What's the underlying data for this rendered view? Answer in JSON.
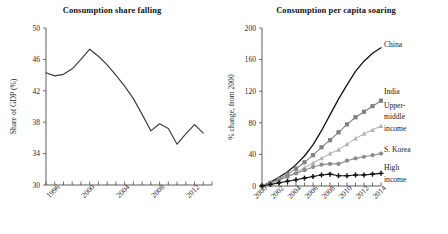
{
  "figure": {
    "panels": [
      {
        "id": "consumption-share",
        "title": "Consumption share falling"
      },
      {
        "id": "consumption-per-capita",
        "title": "Consumption per capita soaring"
      }
    ]
  },
  "chart_data": [
    {
      "type": "line",
      "id": "consumption-share",
      "title": "Consumption share falling",
      "xlabel": "",
      "ylabel": "Share of GDP (%)",
      "xlim": [
        1995,
        2014
      ],
      "ylim": [
        30,
        50
      ],
      "xticks": [
        1996,
        2000,
        2004,
        2008,
        2012
      ],
      "xtick_labels": [
        "1996",
        "2000",
        "2004",
        "2008",
        "2012"
      ],
      "minor_xticks": [
        1995,
        1996,
        1997,
        1998,
        1999,
        2000,
        2001,
        2002,
        2003,
        2004,
        2005,
        2006,
        2007,
        2008,
        2009,
        2010,
        2011,
        2012,
        2013,
        2014
      ],
      "yticks": [
        30,
        34,
        38,
        42,
        46,
        50
      ],
      "ytick_labels": [
        "30",
        "34",
        "38",
        "42",
        "46",
        "50"
      ],
      "grid": false,
      "legend": "none",
      "series": [
        {
          "name": "Share of GDP",
          "color": "#3a3a3a",
          "marker": "none",
          "x": [
            1995,
            1996,
            1997,
            1998,
            1999,
            2000,
            2001,
            2002,
            2003,
            2004,
            2005,
            2006,
            2007,
            2008,
            2009,
            2010,
            2011,
            2012,
            2013
          ],
          "values": [
            44.3,
            43.9,
            44.1,
            44.8,
            46.0,
            47.3,
            46.4,
            45.3,
            44.0,
            42.6,
            41.0,
            39.0,
            36.9,
            37.8,
            37.2,
            35.2,
            36.5,
            37.7,
            36.6
          ]
        }
      ]
    },
    {
      "type": "line",
      "id": "consumption-per-capita",
      "title": "Consumption per capita soaring",
      "xlabel": "",
      "ylabel": "% change, from 2000",
      "xlim": [
        2000,
        2014
      ],
      "ylim": [
        0,
        200
      ],
      "xticks": [
        2000,
        2002,
        2004,
        2006,
        2008,
        2010,
        2012,
        2014
      ],
      "xtick_labels": [
        "2000",
        "2002",
        "2004",
        "2006",
        "2008",
        "2010",
        "2012",
        "2014"
      ],
      "minor_xticks": [
        2000,
        2001,
        2002,
        2003,
        2004,
        2005,
        2006,
        2007,
        2008,
        2009,
        2010,
        2011,
        2012,
        2013,
        2014
      ],
      "yticks": [
        0,
        40,
        80,
        120,
        160,
        200
      ],
      "ytick_labels": [
        "0",
        "40",
        "80",
        "120",
        "160",
        "200"
      ],
      "grid": false,
      "legend": "inline-right",
      "x": [
        2000,
        2001,
        2002,
        2003,
        2004,
        2005,
        2006,
        2007,
        2008,
        2009,
        2010,
        2011,
        2012,
        2013,
        2014
      ],
      "series": [
        {
          "name": "China",
          "label": "China",
          "color": "#111111",
          "marker": "none",
          "values": [
            0,
            5,
            11,
            18,
            27,
            38,
            52,
            70,
            90,
            110,
            128,
            145,
            158,
            168,
            175
          ]
        },
        {
          "name": "India",
          "label": "India",
          "color": "#808080",
          "marker": "square",
          "values": [
            0,
            4,
            9,
            15,
            22,
            30,
            39,
            49,
            58,
            68,
            78,
            87,
            94,
            101,
            108
          ]
        },
        {
          "name": "Upper-middle income",
          "label": "Upper-middle income",
          "color": "#b4b4b4",
          "marker": "triangle",
          "values": [
            0,
            3,
            7,
            12,
            17,
            23,
            29,
            35,
            41,
            46,
            53,
            60,
            66,
            71,
            76
          ]
        },
        {
          "name": "S. Korea",
          "label": "S. Korea",
          "color": "#8c8c8c",
          "marker": "circle",
          "values": [
            0,
            4,
            8,
            12,
            16,
            20,
            24,
            27,
            28,
            28,
            32,
            35,
            37,
            39,
            41
          ]
        },
        {
          "name": "High income",
          "label": "High income",
          "color": "#111111",
          "marker": "plus",
          "values": [
            0,
            2,
            4,
            6,
            8,
            10,
            12,
            14,
            15,
            13,
            13,
            14,
            14,
            15,
            16
          ]
        }
      ]
    }
  ]
}
